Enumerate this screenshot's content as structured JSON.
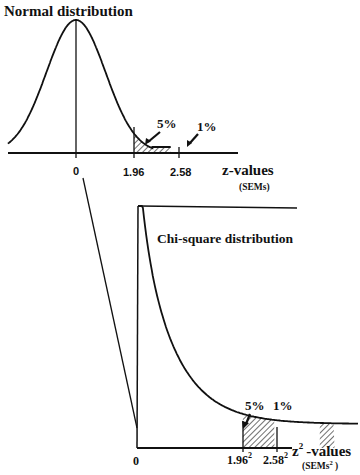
{
  "chart_data": [
    {
      "type": "line",
      "title": "Normal distribution",
      "xlabel": "z-values",
      "xunit": "(SEMs)",
      "xticks": [
        "0",
        "1.96",
        "2.58"
      ],
      "x_range": [
        -3.2,
        3.2
      ],
      "curve": "standard normal density",
      "shaded_regions": [
        {
          "from": 1.96,
          "to": 2.58,
          "label": "5%"
        },
        {
          "from": 2.58,
          "to": 3.2,
          "label": "1%"
        }
      ],
      "grid": false
    },
    {
      "type": "line",
      "title": "Chi-square distribution",
      "xlabel": "-values",
      "xlabel_symbol": "z",
      "xlabel_superscript": "2",
      "xunit": "(SEMs",
      "xunit_superscript": "2",
      "xunit_close": " )",
      "xticks": [
        {
          "base": "0",
          "sup": ""
        },
        {
          "base": "1.96",
          "sup": "2"
        },
        {
          "base": "2.58",
          "sup": "2"
        }
      ],
      "x_range": [
        0,
        8.5
      ],
      "curve": "chi-square density (1 df)",
      "shaded_regions": [
        {
          "from": 3.84,
          "to": 5.0,
          "label": "5%"
        },
        {
          "from": 6.66,
          "to": 7.2,
          "label": "1%"
        }
      ],
      "grid": false
    }
  ]
}
